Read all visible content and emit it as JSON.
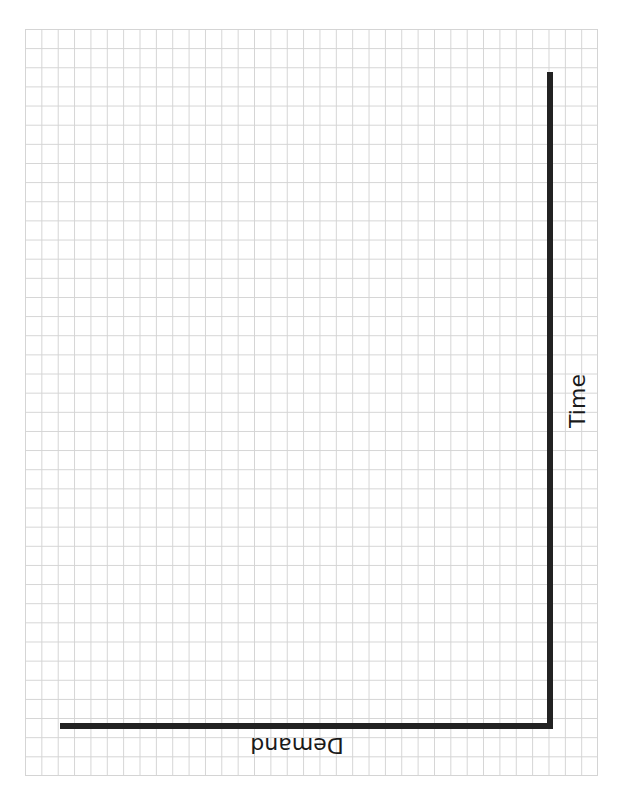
{
  "diagram": {
    "type": "blank-axes-on-grid-paper",
    "background_color": "#ffffff",
    "grid": {
      "line_color": "#d4d4d4",
      "columns": 35,
      "rows": 39
    },
    "axes": {
      "color": "#222222",
      "vertical_axis": {
        "label": "Time",
        "label_orientation": "rotated -90deg (reads bottom-to-top)"
      },
      "horizontal_axis": {
        "label": "Demand",
        "label_orientation": "rotated 180deg (upside down)"
      }
    }
  }
}
